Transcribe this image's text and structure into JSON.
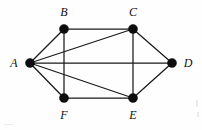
{
  "figure": {
    "width": 202,
    "height": 130,
    "background_color": "#fefefe",
    "edge_color": "#1a1a1a",
    "vertex_color": "#0d0d0d",
    "label_color": "#111111",
    "vertex_radius": 4.6,
    "edge_width": 1.25
  },
  "chart_data": {
    "type": "diagram",
    "graph_type": "undirected-graph",
    "vertex_count": 6,
    "edge_count": 11,
    "vertices": [
      {
        "id": "A",
        "label": "A",
        "x": 30,
        "y": 63,
        "label_x": 14,
        "label_y": 63,
        "degree": 5
      },
      {
        "id": "B",
        "label": "B",
        "x": 64,
        "y": 29,
        "label_x": 64,
        "label_y": 12,
        "degree": 3
      },
      {
        "id": "C",
        "label": "C",
        "x": 133,
        "y": 29,
        "label_x": 133,
        "label_y": 12,
        "degree": 4
      },
      {
        "id": "D",
        "label": "D",
        "x": 172,
        "y": 63,
        "label_x": 188,
        "label_y": 63,
        "degree": 3
      },
      {
        "id": "E",
        "label": "E",
        "x": 133,
        "y": 98,
        "label_x": 133,
        "label_y": 115,
        "degree": 4
      },
      {
        "id": "F",
        "label": "F",
        "x": 64,
        "y": 98,
        "label_x": 64,
        "label_y": 115,
        "degree": 3
      }
    ],
    "edges": [
      {
        "from": "A",
        "to": "B"
      },
      {
        "from": "A",
        "to": "C"
      },
      {
        "from": "A",
        "to": "D"
      },
      {
        "from": "A",
        "to": "E"
      },
      {
        "from": "A",
        "to": "F"
      },
      {
        "from": "B",
        "to": "C"
      },
      {
        "from": "B",
        "to": "F"
      },
      {
        "from": "C",
        "to": "D"
      },
      {
        "from": "C",
        "to": "E"
      },
      {
        "from": "D",
        "to": "E"
      },
      {
        "from": "E",
        "to": "F"
      }
    ]
  }
}
